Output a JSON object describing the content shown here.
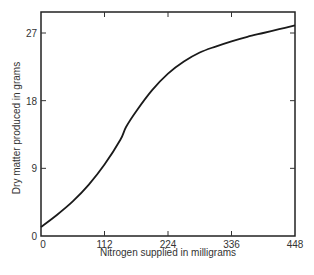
{
  "chart_data": {
    "type": "line",
    "title": "",
    "xlabel": "Nitrogen supplied in milligrams",
    "ylabel": "Dry matter produced in grams",
    "xlim": [
      0,
      448
    ],
    "ylim": [
      0,
      29.8
    ],
    "xticks": [
      0,
      112,
      224,
      336,
      448
    ],
    "yticks": [
      0,
      9,
      18,
      27
    ],
    "grid": false,
    "legend": null,
    "series": [
      {
        "name": "Dry matter",
        "x": [
          0,
          28,
          56,
          84,
          112,
          140,
          150,
          168,
          196,
          224,
          252,
          280,
          308,
          336,
          364,
          392,
          420,
          448
        ],
        "y": [
          1.2,
          2.8,
          4.6,
          6.8,
          9.5,
          12.8,
          14.5,
          16.6,
          19.4,
          21.6,
          23.2,
          24.4,
          25.2,
          25.9,
          26.5,
          27.0,
          27.5,
          28.0
        ]
      }
    ]
  },
  "labels": {
    "xlabel": "Nitrogen supplied in milligrams",
    "ylabel": "Dry matter produced in grams",
    "xticks": [
      "0",
      "112",
      "224",
      "336",
      "448"
    ],
    "yticks": [
      "0",
      "9",
      "18",
      "27"
    ]
  }
}
